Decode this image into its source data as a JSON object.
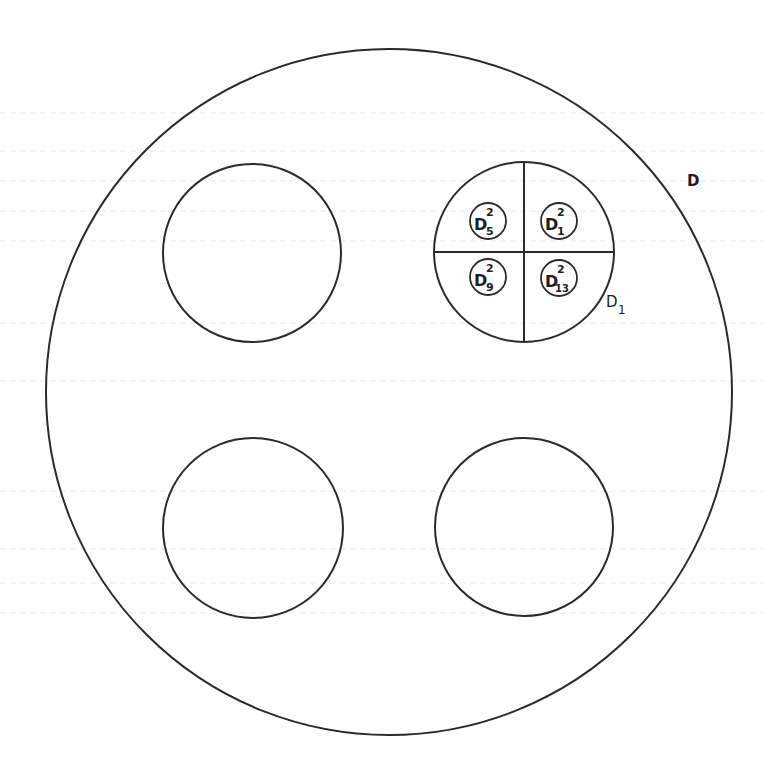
{
  "figure": {
    "outer_disk": {
      "label": "D",
      "cx": 389,
      "cy": 392,
      "r": 344
    },
    "sub_disks": [
      {
        "name": "top-left",
        "cx": 252,
        "cy": 253,
        "r": 89
      },
      {
        "name": "top-right",
        "label_main": "D",
        "label_sub": "1",
        "cx": 524,
        "cy": 252,
        "r": 90,
        "quartered": true
      },
      {
        "name": "bottom-left",
        "cx": 253,
        "cy": 528,
        "r": 90
      },
      {
        "name": "bottom-right",
        "cx": 524,
        "cy": 527,
        "r": 89
      }
    ],
    "quadrant_disks": [
      {
        "position": "top-left",
        "base": "D",
        "sup": "2",
        "sub": "5",
        "cx": 488,
        "cy": 221,
        "r": 18
      },
      {
        "position": "top-right",
        "base": "D",
        "sup": "2",
        "sub": "1",
        "cx": 559,
        "cy": 221,
        "r": 18
      },
      {
        "position": "bottom-left",
        "base": "D",
        "sup": "2",
        "sub": "9",
        "cx": 488,
        "cy": 277,
        "r": 18
      },
      {
        "position": "bottom-right",
        "base": "D",
        "sup": "2",
        "sub": "13",
        "cx": 559,
        "cy": 278,
        "r": 18
      }
    ]
  },
  "labels": {
    "outer": "D",
    "d1_main": "D",
    "d1_sub": "1",
    "q5_base": "D",
    "q5_sup": "2",
    "q5_sub": "5",
    "q1_base": "D",
    "q1_sup": "2",
    "q1_sub": "1",
    "q9_base": "D",
    "q9_sup": "2",
    "q9_sub": "9",
    "q13_base": "D",
    "q13_sup": "2",
    "q13_sub": "13"
  },
  "colors": {
    "ink": "#2a2a2a",
    "paper": "#ffffff"
  }
}
